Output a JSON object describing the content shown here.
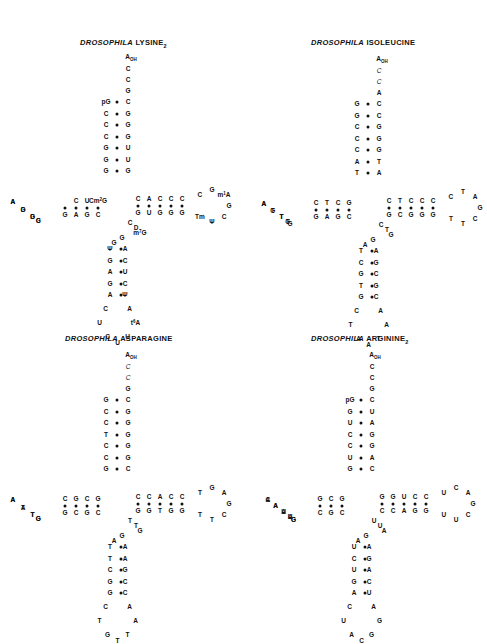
{
  "panels": [
    {
      "id": "lysine2",
      "title": {
        "genus": "DROSOPHILA",
        "name": "LYSINE",
        "subscript": "2"
      },
      "acceptor_end": [
        "A_OH",
        "C",
        "C",
        "G"
      ],
      "acceptor_stem": {
        "left": [
          "pG",
          "C",
          "C",
          "C",
          "G",
          "G",
          "G"
        ],
        "right": [
          "C",
          "G",
          "G",
          "G",
          "U",
          "U",
          "G"
        ]
      },
      "d_stem": {
        "top": [
          "C",
          "U",
          "Cm2G"
        ],
        "bottom": [
          "G",
          "A",
          "G",
          "C"
        ]
      },
      "d_loop": [
        "A",
        "G",
        "D",
        "C",
        "G",
        "G",
        "D",
        "A"
      ],
      "anticodon_stem": {
        "left": [
          "Ψ",
          "G",
          "A",
          "G",
          "A"
        ],
        "right": [
          "A",
          "C",
          "U",
          "C",
          "Ψ"
        ]
      },
      "anticodon_loop": [
        "C",
        "U",
        "C",
        "U",
        "U",
        "t6A",
        "A"
      ],
      "t_stem": {
        "top": [
          "C",
          "A",
          "C",
          "C",
          "C"
        ],
        "bottom": [
          "G",
          "U",
          "G",
          "G",
          "G"
        ]
      },
      "t_loop": [
        "C",
        "G",
        "m1A",
        "G",
        "C",
        "Ψ",
        "Tm"
      ],
      "variable_loop": [
        "C",
        "D",
        "m7G",
        "G",
        "G"
      ],
      "modified_circled": [
        "m1A",
        "Tm",
        "Ψ",
        "Ψ",
        "Ψ"
      ]
    },
    {
      "id": "isoleucine",
      "title": {
        "genus": "DROSOPHILA",
        "name": "ISOLEUCINE",
        "subscript": ""
      },
      "acceptor_end": [
        "A_OH",
        "C",
        "C",
        "A"
      ],
      "acceptor_stem": {
        "left": [
          "G",
          "G",
          "C",
          "C",
          "C",
          "A",
          "T"
        ],
        "right": [
          "C",
          "C",
          "G",
          "G",
          "G",
          "T",
          "A"
        ]
      },
      "d_stem": {
        "top": [
          "C",
          "T",
          "C",
          "G"
        ],
        "bottom": [
          "G",
          "A",
          "G",
          "C"
        ]
      },
      "d_loop": [
        "A",
        "G",
        "T",
        "T",
        "G",
        "G",
        "T",
        "T",
        "A"
      ],
      "anticodon_stem": {
        "left": [
          "T",
          "C",
          "G",
          "T",
          "G"
        ],
        "right": [
          "A",
          "G",
          "C",
          "G",
          "C"
        ]
      },
      "anticodon_loop": [
        "C",
        "T",
        "A",
        "A",
        "T",
        "A",
        "A"
      ],
      "t_stem": {
        "top": [
          "C",
          "T",
          "C",
          "C",
          "C"
        ],
        "bottom": [
          "G",
          "C",
          "G",
          "G",
          "G"
        ]
      },
      "t_loop": [
        "C",
        "T",
        "A",
        "G",
        "C",
        "T",
        "T"
      ],
      "variable_loop": [
        "C",
        "T",
        "G",
        "G",
        "A"
      ]
    },
    {
      "id": "asparagine",
      "title": {
        "genus": "DROSOPHILA",
        "name": "ASPARAGINE",
        "subscript": ""
      },
      "acceptor_end": [
        "A_OH",
        "C",
        "C",
        "G"
      ],
      "acceptor_stem": {
        "left": [
          "G",
          "C",
          "C",
          "T",
          "C",
          "C",
          "G"
        ],
        "right": [
          "C",
          "G",
          "G",
          "G",
          "G",
          "G",
          "C"
        ]
      },
      "d_stem": {
        "top": [
          "C",
          "G",
          "C",
          "G"
        ],
        "bottom": [
          "G",
          "C",
          "G",
          "C"
        ]
      },
      "d_loop": [
        "A",
        "A",
        "T",
        "G",
        "G",
        "T",
        "T",
        "A"
      ],
      "anticodon_stem": {
        "left": [
          "T",
          "T",
          "C",
          "G",
          "G"
        ],
        "right": [
          "A",
          "A",
          "G",
          "C",
          "C"
        ]
      },
      "anticodon_loop": [
        "C",
        "T",
        "G",
        "T",
        "T",
        "A",
        "A"
      ],
      "t_stem": {
        "top": [
          "C",
          "C",
          "A",
          "C",
          "C"
        ],
        "bottom": [
          "G",
          "G",
          "T",
          "G",
          "G"
        ]
      },
      "t_loop": [
        "T",
        "G",
        "A",
        "G",
        "C",
        "T",
        "T"
      ],
      "variable_loop": [
        "T",
        "T",
        "G",
        "G",
        "A"
      ]
    },
    {
      "id": "arginine2",
      "title": {
        "genus": "DROSOPHILA",
        "name": "ARGININE",
        "subscript": "2"
      },
      "acceptor_end": [
        "A_OH",
        "C",
        "C",
        "G"
      ],
      "acceptor_stem": {
        "left": [
          "pG",
          "G",
          "U",
          "C",
          "C",
          "U",
          "G"
        ],
        "right": [
          "C",
          "U",
          "A",
          "G",
          "G",
          "A",
          "C"
        ]
      },
      "d_stem": {
        "top": [
          "G",
          "C",
          "G"
        ],
        "bottom": [
          "C",
          "G",
          "C"
        ]
      },
      "d_loop": [
        "C",
        "A",
        "A",
        "U",
        "G",
        "G",
        "A",
        "U",
        "A",
        "A"
      ],
      "anticodon_stem": {
        "left": [
          "U",
          "C",
          "U",
          "G",
          "A"
        ],
        "right": [
          "A",
          "G",
          "A",
          "C",
          "U"
        ]
      },
      "anticodon_loop": [
        "C",
        "U",
        "A",
        "C",
        "G",
        "G",
        "A"
      ],
      "t_stem": {
        "top": [
          "G",
          "G",
          "U",
          "C",
          "C"
        ],
        "bottom": [
          "C",
          "C",
          "A",
          "G",
          "G"
        ]
      },
      "t_loop": [
        "U",
        "C",
        "A",
        "G",
        "C",
        "U",
        "U"
      ],
      "variable_loop": [
        "U",
        "U",
        "A",
        "G",
        "A"
      ]
    }
  ],
  "labels": {
    "lys_title_genus": "DROSOPHILA",
    "lys_title_name": "LYSINE",
    "lys_title_sub": "2",
    "ile_title_genus": "DROSOPHILA",
    "ile_title_name": "ISOLEUCINE",
    "asn_title_genus": "DROSOPHILA",
    "asn_title_name": "ASPARAGINE",
    "arg_title_genus": "DROSOPHILA",
    "arg_title_name": "ARGININE",
    "arg_title_sub": "2"
  }
}
